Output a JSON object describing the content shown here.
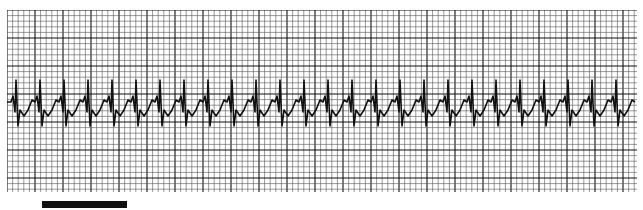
{
  "strip": {
    "type": "ecg-rhythm-strip",
    "grid": {
      "small_px": 5.6,
      "major_every": 5,
      "color_minor": "#555555",
      "color_major": "#111111"
    },
    "trace_color": "#111111",
    "beat_count": 26,
    "beat_spacing_px": 24
  },
  "caption": {
    "text": "",
    "bar_color": "#111111"
  }
}
